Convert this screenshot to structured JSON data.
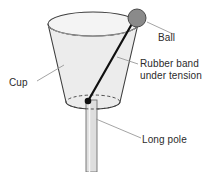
{
  "figure": {
    "type": "physics-apparatus-diagram"
  },
  "labels": {
    "ball": "Ball",
    "rubber_band_line1": "Rubber band",
    "rubber_band_line2": "under tension",
    "cup": "Cup",
    "pole": "Long pole"
  },
  "parts": {
    "ball": {
      "name": "ball",
      "shape": "circle",
      "cx": 137,
      "cy": 18,
      "r": 9,
      "fill": "#8a8a8a",
      "stroke": "#4a4a4a"
    },
    "cup": {
      "name": "cup",
      "shape": "truncated-cone",
      "rim_cx": 93,
      "rim_cy": 24,
      "rim_rx": 45,
      "rim_ry": 12,
      "base_cx": 93,
      "base_cy": 102,
      "base_rx": 27,
      "base_ry": 7,
      "fill": "#ececec",
      "stroke": "#3d3d3d"
    },
    "rubber_band": {
      "name": "rubber-band",
      "shape": "line",
      "x1": 88,
      "y1": 101,
      "x2": 133,
      "y2": 22,
      "stroke": "#101010",
      "width": 2.2
    },
    "anchor": {
      "name": "rubber-band-anchor",
      "shape": "dot",
      "cx": 88,
      "cy": 101,
      "r": 3.2,
      "fill": "#101010"
    },
    "pole": {
      "name": "long-pole",
      "shape": "cylinder",
      "x": 86,
      "y": 104,
      "width": 11,
      "height": 68,
      "fill": "#dedede",
      "stroke": "#6f6f6f"
    }
  },
  "leaders": [
    {
      "name": "ball-leader",
      "x1": 147,
      "y1": 22,
      "x2": 172,
      "y2": 34
    },
    {
      "name": "rubber-band-leader",
      "x1": 118,
      "y1": 58,
      "x2": 138,
      "y2": 64
    },
    {
      "name": "cup-leader",
      "x1": 37,
      "y1": 81,
      "x2": 63,
      "y2": 65
    },
    {
      "name": "pole-leader",
      "x1": 96,
      "y1": 119,
      "x2": 141,
      "y2": 138
    }
  ],
  "colors": {
    "background": "#ffffff",
    "outline": "#3d3d3d",
    "ball_fill": "#8a8a8a",
    "cup_fill": "#ececec",
    "pole_fill": "#dedede",
    "band": "#101010",
    "leader": "#9a9a9a",
    "text": "#2b2b2b"
  }
}
